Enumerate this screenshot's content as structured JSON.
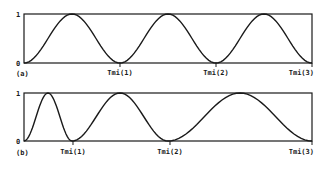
{
  "chart_data": [
    {
      "type": "line",
      "panel_label": "(a)",
      "title": "",
      "xlabel": "",
      "ylabel": "",
      "ylim": [
        0,
        1
      ],
      "y_ticks": [
        "0",
        "1"
      ],
      "x_ticks": [
        "Tmi(1)",
        "Tmi(2)",
        "Tmi(3)"
      ],
      "x_tick_positions": [
        1,
        2,
        3
      ],
      "xlim": [
        0,
        3
      ],
      "grid": false,
      "description": "Periodic raised-cosine humps of equal width; each interval [Tmi(k-1), Tmi(k)] contains one hump from 0 to 1 back to 0",
      "series": [
        {
          "name": "signal",
          "x": [
            0,
            0.25,
            0.5,
            0.75,
            1,
            1.25,
            1.5,
            1.75,
            2,
            2.25,
            2.5,
            2.75,
            3
          ],
          "values": [
            0,
            0.5,
            1,
            0.5,
            0,
            0.5,
            1,
            0.5,
            0,
            0.5,
            1,
            0.5,
            0
          ]
        }
      ]
    },
    {
      "type": "line",
      "panel_label": "(b)",
      "title": "",
      "xlabel": "",
      "ylabel": "",
      "ylim": [
        0,
        1
      ],
      "y_ticks": [
        "0",
        "1"
      ],
      "x_ticks": [
        "Tmi(1)",
        "Tmi(2)",
        "Tmi(3)"
      ],
      "x_tick_positions": [
        1,
        3,
        6
      ],
      "xlim": [
        0,
        6
      ],
      "grid": false,
      "description": "Raised-cosine humps with increasing width (ratio ~1:2:3); zeros at Tmi(1), Tmi(2), Tmi(3)",
      "series": [
        {
          "name": "signal",
          "x": [
            0,
            0.5,
            1,
            2,
            3,
            4.5,
            6
          ],
          "values": [
            0,
            1,
            0,
            1,
            0,
            1,
            0
          ]
        }
      ]
    }
  ],
  "panels": [
    {
      "label": "(a)",
      "y_top": "1",
      "y_bottom": "0",
      "ticks": [
        {
          "label": "Tmi(1)",
          "frac": 0.3333
        },
        {
          "label": "Tmi(2)",
          "frac": 0.6667
        },
        {
          "label": "Tmi(3)",
          "frac": 1.0
        }
      ],
      "segments": [
        1,
        1,
        1
      ]
    },
    {
      "label": "(b)",
      "y_top": "1",
      "y_bottom": "0",
      "ticks": [
        {
          "label": "Tmi(1)",
          "frac": 0.1701
        },
        {
          "label": "Tmi(2)",
          "frac": 0.5069
        },
        {
          "label": "Tmi(3)",
          "frac": 1.0
        }
      ],
      "segments": [
        1,
        2,
        3
      ]
    }
  ]
}
